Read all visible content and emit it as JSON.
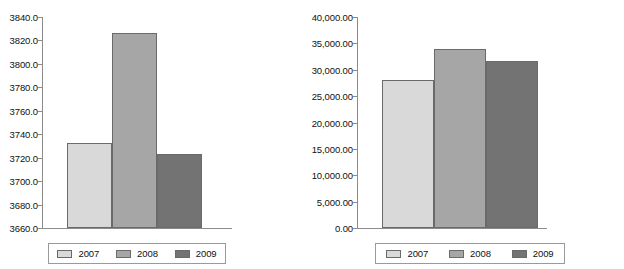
{
  "colors": {
    "series_2007": "#d9d9d9",
    "series_2008": "#a6a6a6",
    "series_2009": "#737373",
    "axis": "#8c8c8c",
    "bar_border": "#6a6a6a",
    "legend_border": "#9a9a9a",
    "background": "#ffffff",
    "text": "#111111"
  },
  "legend": {
    "entries": [
      {
        "label": "2007",
        "swatch": "legend-swatch-2007"
      },
      {
        "label": "2008",
        "swatch": "legend-swatch-2008"
      },
      {
        "label": "2009",
        "swatch": "legend-swatch-2009"
      }
    ]
  },
  "chart_data": [
    {
      "type": "bar",
      "title": "",
      "xlabel": "",
      "ylabel": "",
      "categories": [
        "2007",
        "2008",
        "2009"
      ],
      "values": [
        3732.5,
        3826.0,
        3723.5
      ],
      "ylim": [
        3660.0,
        3840.0
      ],
      "ytick_values": [
        3840.0,
        3820.0,
        3800.0,
        3780.0,
        3760.0,
        3740.0,
        3720.0,
        3700.0,
        3680.0,
        3660.0
      ],
      "ytick_labels": [
        "3840.0",
        "3820.0",
        "3800.0",
        "3780.0",
        "3760.0",
        "3740.0",
        "3720.0",
        "3700.0",
        "3680.0",
        "3660.0"
      ],
      "grid": false,
      "legend_position": "bottom",
      "series": [
        {
          "name": "2007",
          "values": [
            3732.5
          ]
        },
        {
          "name": "2008",
          "values": [
            3826.0
          ]
        },
        {
          "name": "2009",
          "values": [
            3723.5
          ]
        }
      ]
    },
    {
      "type": "bar",
      "title": "",
      "xlabel": "",
      "ylabel": "",
      "categories": [
        "2007",
        "2008",
        "2009"
      ],
      "values": [
        28000.0,
        34000.0,
        31700.0
      ],
      "ylim": [
        0.0,
        40000.0
      ],
      "ytick_values": [
        40000,
        35000,
        30000,
        25000,
        20000,
        15000,
        10000,
        5000,
        0
      ],
      "ytick_labels": [
        "40,000.00",
        "35,000.00",
        "30,000.00",
        "25,000.00",
        "20,000.00",
        "15,000.00",
        "10,000.00",
        "5,000.00",
        "0.00"
      ],
      "grid": false,
      "legend_position": "bottom",
      "series": [
        {
          "name": "2007",
          "values": [
            28000.0
          ]
        },
        {
          "name": "2008",
          "values": [
            34000.0
          ]
        },
        {
          "name": "2009",
          "values": [
            31700.0
          ]
        }
      ]
    }
  ]
}
